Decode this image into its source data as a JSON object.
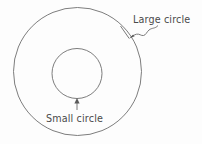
{
  "figure": {
    "title": "",
    "background_color": "#fdfdfd",
    "stroke_color": "#6e6e6e",
    "text_color": "#4a4a4a"
  },
  "shapes": {
    "large_circle": {
      "name": "large-circle",
      "cx": 77.5,
      "cy": 71.5,
      "r": 64
    },
    "small_circle": {
      "name": "small-circle",
      "cx": 77,
      "cy": 73.5,
      "r": 25
    }
  },
  "annotations": {
    "large_circle_label": {
      "text": "Large circle",
      "x": 133,
      "y": 23,
      "leader": "squiggle"
    },
    "small_circle_label": {
      "text": "Small circle",
      "x": 46,
      "y": 122,
      "leader": "straight-arrow"
    }
  }
}
